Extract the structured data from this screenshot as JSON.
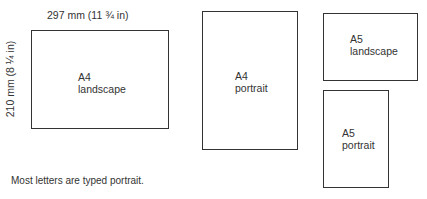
{
  "dimensions": {
    "width_label": "297 mm (11 ¾ in)",
    "height_label": "210 mm (8 ¼ in)"
  },
  "sheets": [
    {
      "size": "A4",
      "orientation": "landscape"
    },
    {
      "size": "A4",
      "orientation": "portrait"
    },
    {
      "size": "A5",
      "orientation": "landscape"
    },
    {
      "size": "A5",
      "orientation": "portrait"
    }
  ],
  "note": "Most letters are typed portrait."
}
